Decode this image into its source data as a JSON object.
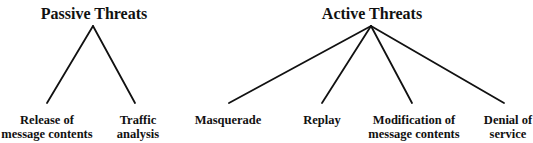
{
  "groups": [
    {
      "title": "Passive Threats",
      "apex": [
        93,
        26
      ],
      "children": [
        {
          "line1": "Release of",
          "line2": "message contents",
          "end": [
            47,
            103
          ],
          "cx": 47
        },
        {
          "line1": "Traffic",
          "line2": "analysis",
          "end": [
            135,
            103
          ],
          "cx": 138
        }
      ]
    },
    {
      "title": "Active Threats",
      "apex": [
        371,
        26
      ],
      "children": [
        {
          "line1": "Masquerade",
          "line2": "",
          "end": [
            229,
            103
          ],
          "cx": 228
        },
        {
          "line1": "Replay",
          "line2": "",
          "end": [
            322,
            103
          ],
          "cx": 322
        },
        {
          "line1": "Modification of",
          "line2": "message contents",
          "end": [
            412,
            103
          ],
          "cx": 414
        },
        {
          "line1": "Denial of",
          "line2": "service",
          "end": [
            504,
            103
          ],
          "cx": 508
        }
      ]
    }
  ],
  "colors": {
    "line": "#111111",
    "text": "#111111",
    "background": "#ffffff"
  }
}
